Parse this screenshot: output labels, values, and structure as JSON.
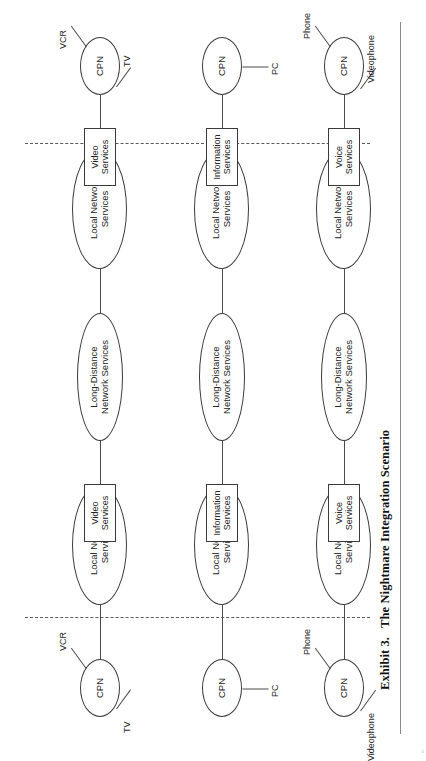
{
  "figure": {
    "caption_number": "Exhibit 3.",
    "caption_title": "The Nightmare Integration Scenario",
    "orientation": "rotated-90-ccw",
    "page_mark": "1"
  },
  "labels": {
    "cpn": "CPN",
    "local_network_services": "Local Network\nServices",
    "long_distance_network_services": "Long-Distance\nNetwork Services",
    "video_services": "Video\nServices",
    "information_services": "Information\nServices",
    "voice_services": "Voice\nServices",
    "tv": "TV",
    "vcr": "VCR",
    "pc": "PC",
    "videophone": "Videophone",
    "phone": "Phone"
  },
  "rows": [
    {
      "id": "video",
      "service_box": "Video\nServices",
      "left_cpn": {
        "label": "CPN",
        "terminals": [
          "TV",
          "VCR"
        ]
      },
      "right_cpn": {
        "label": "CPN",
        "terminals": [
          "TV",
          "VCR"
        ]
      },
      "chain": [
        "CPN",
        "Local Network\nServices",
        "Long-Distance\nNetwork Services",
        "Local Network\nServices",
        "CPN"
      ]
    },
    {
      "id": "information",
      "service_box": "Information\nServices",
      "left_cpn": {
        "label": "CPN",
        "terminals": [
          "PC"
        ]
      },
      "right_cpn": {
        "label": "CPN",
        "terminals": [
          "PC"
        ]
      },
      "chain": [
        "CPN",
        "Local Network\nServices",
        "Long-Distance\nNetwork Services",
        "Local Network\nServices",
        "CPN"
      ]
    },
    {
      "id": "voice",
      "service_box": "Voice\nServices",
      "left_cpn": {
        "label": "CPN",
        "terminals": [
          "Videophone",
          "Phone"
        ]
      },
      "right_cpn": {
        "label": "CPN",
        "terminals": [
          "Videophone",
          "Phone"
        ]
      },
      "chain": [
        "CPN",
        "Local Network\nServices",
        "Long-Distance\nNetwork Services",
        "Local Network\nServices",
        "CPN"
      ]
    }
  ],
  "demarcation_lines": {
    "style": "dashed",
    "count": 2,
    "meaning": "customer-premises / network boundary"
  },
  "colors": {
    "stroke": "#3a3a3a",
    "edge": "#4a4a4a",
    "text": "#242424",
    "background": "#ffffff",
    "page_rule": "#8a8a8a"
  }
}
